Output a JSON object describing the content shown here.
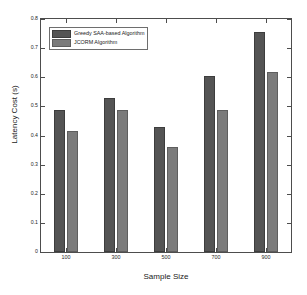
{
  "chart_data": {
    "type": "bar",
    "title": "",
    "xlabel": "Sample Size",
    "ylabel": "Latency Cost (s)",
    "categories": [
      "100",
      "300",
      "500",
      "700",
      "900"
    ],
    "series": [
      {
        "name": "Greedy SAA-based Algorithm",
        "color": "#545454",
        "values": [
          0.486,
          0.53,
          0.43,
          0.605,
          0.757
        ]
      },
      {
        "name": "JCORM Algorithm",
        "color": "#7b7b7b",
        "values": [
          0.416,
          0.486,
          0.36,
          0.489,
          0.617
        ]
      }
    ],
    "ylim": [
      0,
      0.8
    ],
    "yticks": [
      "0",
      "0.1",
      "0.2",
      "0.3",
      "0.4",
      "0.5",
      "0.6",
      "0.7",
      "0.8"
    ],
    "ytick_values": [
      0,
      0.1,
      0.2,
      0.3,
      0.4,
      0.5,
      0.6,
      0.7,
      0.8
    ],
    "xticks": [
      "100",
      "300",
      "500",
      "700",
      "900"
    ],
    "grid": false,
    "legend_position": "top-left",
    "legend": [
      "Greedy SAA-based Algorithm",
      "JCORM Algorithm"
    ],
    "axis_color": "#4d4d4d",
    "background": "#ffffff"
  }
}
